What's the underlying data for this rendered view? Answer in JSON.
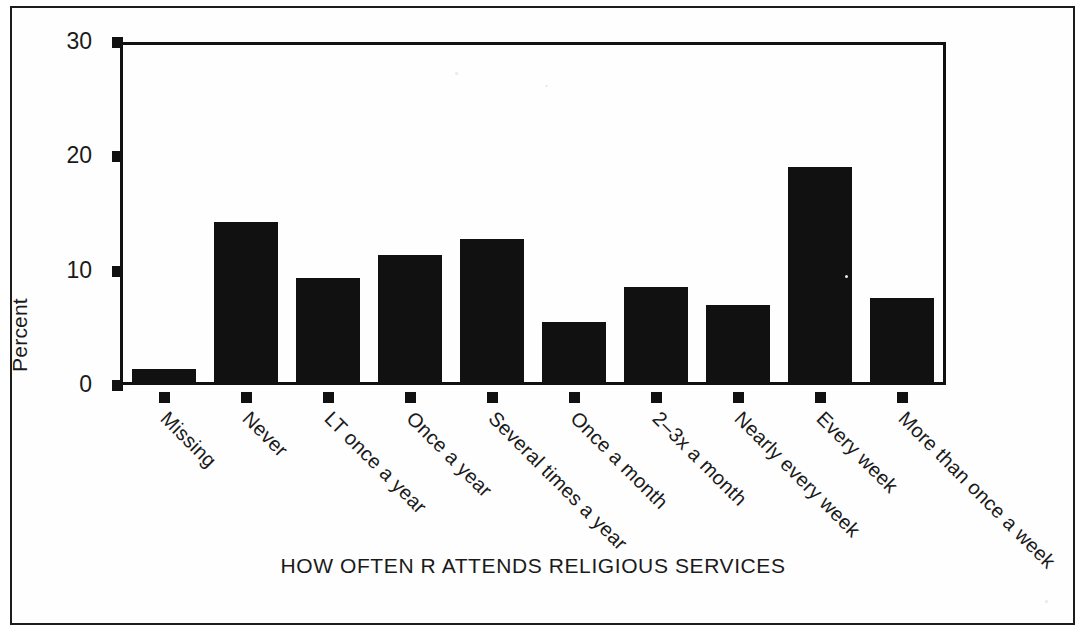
{
  "chart_data": {
    "type": "bar",
    "title": "",
    "xlabel": "HOW OFTEN R ATTENDS RELIGIOUS SERVICES",
    "ylabel": "Percent",
    "ylim": [
      0,
      30
    ],
    "yticks": [
      0,
      10,
      20,
      30
    ],
    "ytick_labels": [
      "0",
      "10",
      "20",
      "30"
    ],
    "grid": false,
    "legend": null,
    "bar_color": "#111111",
    "categories": [
      "Missing",
      "Never",
      "LT once a year",
      "Once a year",
      "Several times a year",
      "Once a month",
      "2–3x a month",
      "Nearly every week",
      "Every week",
      "More than once a week"
    ],
    "values": [
      1.4,
      14.3,
      9.4,
      11.4,
      12.8,
      5.5,
      8.6,
      7.0,
      19.1,
      7.6
    ]
  }
}
